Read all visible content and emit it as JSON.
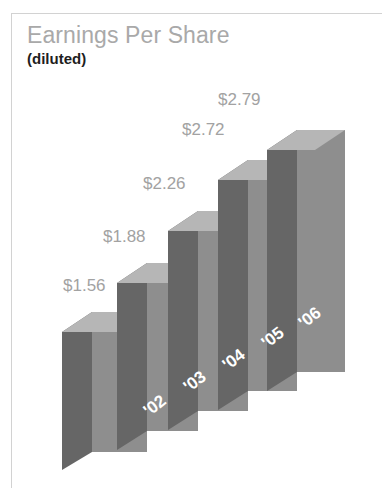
{
  "header": {
    "title": "Earnings Per Share",
    "subtitle": "(diluted)"
  },
  "colors": {
    "title": "#a9a9a9",
    "subtitle": "#1e1e1e",
    "value_label": "#a2a2a2",
    "year_label": "#ffffff",
    "bar_front": "#8e8e8e",
    "bar_side": "#666666",
    "bar_top": "#b6b6b6",
    "frame": "#d2d2d2",
    "background": "#ffffff"
  },
  "chart_data": {
    "type": "bar",
    "title": "Earnings Per Share",
    "subtitle": "(diluted)",
    "xlabel": "",
    "ylabel": "",
    "categories": [
      "'02",
      "'03",
      "'04",
      "'05",
      "'06"
    ],
    "values": [
      1.56,
      1.88,
      2.26,
      2.72,
      2.79
    ],
    "value_labels": [
      "$1.56",
      "$1.88",
      "$2.26",
      "$2.72",
      "$2.79"
    ],
    "ylim": [
      0,
      2.79
    ],
    "grid": false,
    "legend": false,
    "style": "3d-isometric",
    "units": "USD per share"
  },
  "bars": [
    {
      "name": "bar-2002",
      "category": "'02",
      "value": 1.56,
      "value_label": "$1.56",
      "label_x": 63,
      "label_y": 276,
      "year_label_x": 146,
      "year_label_y": 404,
      "front": "92,312 147,312 147,452 92,452",
      "side": "62,332 92,312 92,452 62,470",
      "top": "62,332 92,312 147,312 117,332"
    },
    {
      "name": "bar-2003",
      "category": "'03",
      "value": 1.88,
      "value_label": "$1.88",
      "label_x": 103,
      "label_y": 227,
      "year_label_x": 186,
      "year_label_y": 380,
      "front": "147,263 198,263 198,431 147,431",
      "side": "117,283 147,263 147,431 117,450",
      "top": "117,283 147,263 198,263 168,283"
    },
    {
      "name": "bar-2004",
      "category": "'04",
      "value": 2.26,
      "value_label": "$2.26",
      "label_x": 143,
      "label_y": 174,
      "year_label_x": 225,
      "year_label_y": 358,
      "front": "198,211 248,211 248,411 198,411",
      "side": "168,231 198,211 198,411 168,430",
      "top": "168,231 198,211 248,211 218,231"
    },
    {
      "name": "bar-2005",
      "category": "'05",
      "value": 2.72,
      "value_label": "$2.72",
      "label_x": 182,
      "label_y": 120,
      "year_label_x": 264,
      "year_label_y": 336,
      "front": "248,160 297,160 297,391 248,391",
      "side": "218,180 248,160 248,391 218,410",
      "top": "218,180 248,160 297,160 267,180"
    },
    {
      "name": "bar-2006",
      "category": "'06",
      "value": 2.79,
      "value_label": "$2.79",
      "label_x": 218,
      "label_y": 90,
      "year_label_x": 301,
      "year_label_y": 316,
      "front": "297,130 345,130 345,372 297,372",
      "side": "267,150 297,130 297,372 267,391",
      "top": "267,150 297,130 345,130 315,150"
    }
  ]
}
